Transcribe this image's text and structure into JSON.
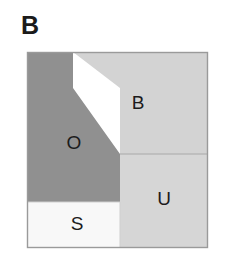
{
  "panel": {
    "label": "B",
    "background_color": "#ffffff"
  },
  "diagram": {
    "type": "region-partition-square",
    "frame": {
      "x": 27,
      "y": 52,
      "width": 181,
      "height": 196,
      "border_color": "#9a9a9a"
    },
    "regions": [
      {
        "key": "O",
        "label": "O",
        "color": "#909090",
        "label_x": 74,
        "label_y": 144,
        "description": "upper-left dark region with diagonal lower-right edge"
      },
      {
        "key": "B",
        "label": "B",
        "color": "#d3d3d3",
        "label_x": 138,
        "label_y": 104,
        "description": "upper-right light region"
      },
      {
        "key": "U",
        "label": "U",
        "color": "#d6d6d6",
        "label_x": 164,
        "label_y": 200,
        "description": "lower-right light region"
      },
      {
        "key": "S",
        "label": "S",
        "color": "#f8f8f8",
        "label_x": 77,
        "label_y": 225,
        "description": "lower-left white region"
      }
    ],
    "edges": {
      "o_vertical_top_x": 73,
      "o_diagonal_start_y": 88,
      "o_diagonal_end_x": 120,
      "bu_divider_y": 154,
      "s_top_y": 202,
      "s_right_x": 120
    }
  }
}
